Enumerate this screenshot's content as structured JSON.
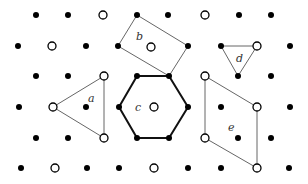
{
  "diagram": {
    "filled_points": [
      [
        36,
        15
      ],
      [
        68,
        15
      ],
      [
        137,
        15
      ],
      [
        168,
        15
      ],
      [
        239,
        15
      ],
      [
        271,
        15
      ],
      [
        18,
        46
      ],
      [
        86,
        46
      ],
      [
        118,
        46
      ],
      [
        188,
        46
      ],
      [
        221,
        46
      ],
      [
        290,
        46
      ],
      [
        36,
        76
      ],
      [
        68,
        76
      ],
      [
        137,
        76
      ],
      [
        169,
        76
      ],
      [
        238,
        76
      ],
      [
        271,
        76
      ],
      [
        19,
        107
      ],
      [
        86,
        107
      ],
      [
        119,
        107
      ],
      [
        188,
        107
      ],
      [
        221,
        107
      ],
      [
        290,
        107
      ],
      [
        36,
        138
      ],
      [
        68,
        138
      ],
      [
        137,
        138
      ],
      [
        169,
        138
      ],
      [
        238,
        138
      ],
      [
        271,
        138
      ],
      [
        21,
        168
      ],
      [
        87,
        168
      ],
      [
        119,
        168
      ],
      [
        188,
        168
      ],
      [
        221,
        168
      ],
      [
        289,
        168
      ]
    ],
    "open_points": [
      [
        103,
        15
      ],
      [
        205,
        15
      ],
      [
        52,
        46
      ],
      [
        151,
        47
      ],
      [
        257,
        46
      ],
      [
        104,
        76
      ],
      [
        205,
        76
      ],
      [
        53,
        107
      ],
      [
        154,
        107
      ],
      [
        257,
        107
      ],
      [
        104,
        138
      ],
      [
        205,
        138
      ],
      [
        55,
        168
      ],
      [
        154,
        168
      ],
      [
        257,
        168
      ]
    ],
    "shapes": [
      {
        "id": "a",
        "label": "a",
        "points": [
          [
            53,
            107
          ],
          [
            104,
            76
          ],
          [
            104,
            138
          ]
        ],
        "stroke": "#666666",
        "width": 1,
        "label_pos": [
          88,
          102
        ]
      },
      {
        "id": "b",
        "label": "b",
        "points": [
          [
            137,
            15
          ],
          [
            188,
            46
          ],
          [
            169,
            76
          ],
          [
            118,
            46
          ]
        ],
        "stroke": "#666666",
        "width": 1,
        "label_pos": [
          136,
          40
        ]
      },
      {
        "id": "c",
        "label": "c",
        "points": [
          [
            137,
            76
          ],
          [
            169,
            76
          ],
          [
            188,
            107
          ],
          [
            169,
            138
          ],
          [
            137,
            138
          ],
          [
            119,
            107
          ]
        ],
        "stroke": "#111111",
        "width": 2,
        "label_pos": [
          135,
          111
        ]
      },
      {
        "id": "d",
        "label": "d",
        "points": [
          [
            221,
            46
          ],
          [
            257,
            46
          ],
          [
            238,
            76
          ]
        ],
        "stroke": "#666666",
        "width": 1,
        "label_pos": [
          236,
          62
        ]
      },
      {
        "id": "e",
        "label": "e",
        "points": [
          [
            205,
            76
          ],
          [
            257,
            107
          ],
          [
            257,
            168
          ],
          [
            205,
            138
          ]
        ],
        "stroke": "#666666",
        "width": 1,
        "label_pos": [
          228,
          131
        ]
      }
    ]
  }
}
